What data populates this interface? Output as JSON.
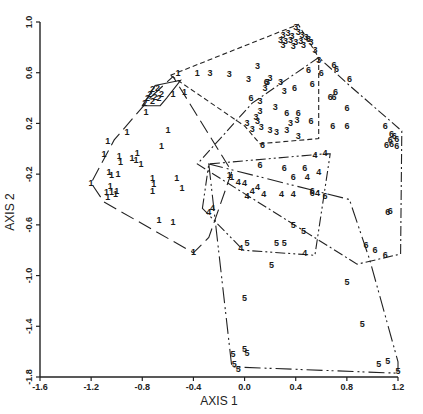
{
  "chart_data": {
    "type": "scatter",
    "title": "",
    "xlabel": "AXIS 1",
    "ylabel": "AXIS 2",
    "xlim": [
      -1.6,
      1.2
    ],
    "ylim": [
      -1.8,
      1.0
    ],
    "xticks": [
      -1.6,
      -1.2,
      -0.8,
      -0.4,
      0.0,
      0.4,
      0.8,
      1.2
    ],
    "xtick_labels": [
      "-1.6",
      "-1.2",
      "-0.8",
      "-0.4",
      "0.0",
      "0.4",
      "0.8",
      "1.2"
    ],
    "yticks": [
      1.0,
      0.6,
      0.2,
      -0.2,
      -0.6,
      -1.0,
      -1.4,
      -1.8
    ],
    "ytick_labels": [
      "1.0",
      "0.6",
      "0.2",
      "-0.2",
      "-0.6",
      "-1.0",
      "-1.4",
      "-1.8"
    ],
    "grid": false,
    "legend": "none (points labeled by group number 1-6; convex hulls enclose each group)",
    "series": [
      {
        "name": "1",
        "marker": "1",
        "hull_style": "long-dash",
        "points": [
          [
            -0.56,
            0.43
          ],
          [
            -0.47,
            0.45
          ],
          [
            -0.77,
            0.29
          ],
          [
            -0.92,
            0.13
          ],
          [
            -0.6,
            0.15
          ],
          [
            -1.07,
            0.06
          ],
          [
            -1.1,
            -0.04
          ],
          [
            -0.98,
            -0.06
          ],
          [
            -0.97,
            -0.1
          ],
          [
            -0.88,
            -0.07
          ],
          [
            -0.85,
            -0.09
          ],
          [
            -0.84,
            -0.03
          ],
          [
            -0.81,
            -0.12
          ],
          [
            -1.06,
            -0.18
          ],
          [
            -1.04,
            -0.21
          ],
          [
            -0.99,
            -0.2
          ],
          [
            -1.05,
            -0.29
          ],
          [
            -1.08,
            -0.34
          ],
          [
            -1.04,
            -0.34
          ],
          [
            -1.01,
            -0.36
          ],
          [
            -1.0,
            -0.33
          ],
          [
            -1.07,
            -0.38
          ],
          [
            -0.72,
            -0.23
          ],
          [
            -0.71,
            -0.28
          ],
          [
            -0.72,
            -0.33
          ],
          [
            -0.53,
            -0.23
          ],
          [
            -0.49,
            -0.31
          ],
          [
            -0.67,
            -0.56
          ],
          [
            -0.56,
            -0.58
          ],
          [
            -0.4,
            -0.81
          ],
          [
            -1.2,
            -0.27
          ],
          [
            -0.12,
            -0.21
          ],
          [
            -0.1,
            -0.22
          ],
          [
            -0.65,
            0.02
          ],
          [
            -0.52,
            0.6
          ],
          [
            -0.37,
            0.6
          ]
        ],
        "hull": [
          [
            -0.72,
            0.42
          ],
          [
            -0.56,
            0.57
          ],
          [
            -0.1,
            -0.18
          ],
          [
            -0.28,
            -0.7
          ],
          [
            -0.4,
            -0.82
          ],
          [
            -1.1,
            -0.42
          ],
          [
            -1.2,
            -0.27
          ],
          [
            -1.02,
            0.07
          ]
        ]
      },
      {
        "name": "2",
        "marker": "2",
        "hull_style": "solid",
        "points": [
          [
            -0.72,
            0.47
          ],
          [
            -0.68,
            0.48
          ],
          [
            -0.74,
            0.43
          ],
          [
            -0.7,
            0.41
          ],
          [
            -0.76,
            0.4
          ],
          [
            -0.72,
            0.38
          ],
          [
            -0.67,
            0.4
          ],
          [
            -0.78,
            0.36
          ],
          [
            -0.65,
            0.43
          ]
        ],
        "hull": [
          [
            -0.8,
            0.34
          ],
          [
            -0.7,
            0.5
          ],
          [
            -0.5,
            0.54
          ],
          [
            -0.61,
            0.4
          ],
          [
            -0.66,
            0.34
          ]
        ]
      },
      {
        "name": "3",
        "marker": "3",
        "hull_style": "short-dash",
        "points": [
          [
            0.4,
            0.96
          ],
          [
            0.3,
            0.9
          ],
          [
            0.34,
            0.91
          ],
          [
            0.37,
            0.89
          ],
          [
            0.42,
            0.92
          ],
          [
            0.45,
            0.9
          ],
          [
            0.48,
            0.88
          ],
          [
            0.28,
            0.86
          ],
          [
            0.32,
            0.85
          ],
          [
            0.36,
            0.86
          ],
          [
            0.4,
            0.84
          ],
          [
            0.44,
            0.85
          ],
          [
            0.5,
            0.87
          ],
          [
            0.52,
            0.84
          ],
          [
            0.3,
            0.82
          ],
          [
            0.38,
            0.81
          ],
          [
            0.46,
            0.82
          ],
          [
            0.55,
            0.78
          ],
          [
            0.58,
            0.7
          ],
          [
            0.1,
            0.65
          ],
          [
            -0.27,
            0.6
          ],
          [
            -0.12,
            0.59
          ],
          [
            0.03,
            0.55
          ],
          [
            0.18,
            0.53
          ],
          [
            0.28,
            0.53
          ],
          [
            0.31,
            0.46
          ],
          [
            0.16,
            0.48
          ],
          [
            0.2,
            0.56
          ],
          [
            0.12,
            0.38
          ],
          [
            0.24,
            0.33
          ],
          [
            0.12,
            0.3
          ],
          [
            0.09,
            0.25
          ],
          [
            0.1,
            0.22
          ],
          [
            0.13,
            0.17
          ],
          [
            0.2,
            0.15
          ],
          [
            0.25,
            0.13
          ],
          [
            0.33,
            0.15
          ],
          [
            0.36,
            0.2
          ],
          [
            0.41,
            0.23
          ],
          [
            0.42,
            0.1
          ],
          [
            0.02,
            0.2
          ],
          [
            0.06,
            0.16
          ]
        ],
        "hull": [
          [
            -0.58,
            0.58
          ],
          [
            0.42,
            0.98
          ],
          [
            0.58,
            0.72
          ],
          [
            0.58,
            0.08
          ],
          [
            0.12,
            0.04
          ],
          [
            0.0,
            0.18
          ]
        ]
      },
      {
        "name": "4",
        "marker": "4",
        "hull_style": "dash-dot-dot",
        "points": [
          [
            -0.28,
            -0.5
          ],
          [
            -0.25,
            -0.47
          ],
          [
            -0.05,
            -0.26
          ],
          [
            0.0,
            -0.27
          ],
          [
            0.06,
            -0.33
          ],
          [
            0.1,
            -0.3
          ],
          [
            0.02,
            -0.37
          ],
          [
            0.15,
            -0.36
          ],
          [
            0.29,
            -0.36
          ],
          [
            0.38,
            -0.36
          ],
          [
            0.49,
            -0.22
          ],
          [
            0.55,
            -0.05
          ],
          [
            0.58,
            -0.18
          ],
          [
            0.57,
            -0.35
          ],
          [
            0.47,
            -0.82
          ],
          [
            -0.03,
            -0.78
          ],
          [
            0.63,
            -0.03
          ]
        ],
        "hull": [
          [
            -0.33,
            -0.47
          ],
          [
            -0.28,
            -0.12
          ],
          [
            0.62,
            -0.04
          ],
          [
            0.67,
            -0.04
          ],
          [
            0.55,
            -0.84
          ],
          [
            -0.01,
            -0.8
          ]
        ]
      },
      {
        "name": "5",
        "marker": "5",
        "hull_style": "long-dash-dot-dot",
        "points": [
          [
            0.38,
            -0.6
          ],
          [
            0.46,
            -0.65
          ],
          [
            0.25,
            -0.74
          ],
          [
            0.31,
            -0.74
          ],
          [
            0.02,
            -0.74
          ],
          [
            0.21,
            -0.92
          ],
          [
            0.0,
            -1.18
          ],
          [
            0.8,
            -1.05
          ],
          [
            0.0,
            -1.58
          ],
          [
            0.02,
            -1.61
          ],
          [
            -0.08,
            -1.7
          ],
          [
            -0.05,
            -1.74
          ],
          [
            0.92,
            -1.38
          ],
          [
            1.05,
            -1.7
          ],
          [
            1.12,
            -1.67
          ],
          [
            1.2,
            -1.75
          ],
          [
            -0.09,
            -1.62
          ]
        ],
        "hull": [
          [
            -0.28,
            -0.12
          ],
          [
            -0.1,
            -1.72
          ],
          [
            1.2,
            -1.77
          ],
          [
            1.2,
            -1.68
          ],
          [
            0.98,
            -0.88
          ],
          [
            0.82,
            -0.4
          ]
        ]
      },
      {
        "name": "6",
        "marker": "6",
        "hull_style": "dash-dot",
        "points": [
          [
            0.7,
            0.66
          ],
          [
            0.72,
            0.63
          ],
          [
            0.82,
            0.55
          ],
          [
            0.5,
            0.62
          ],
          [
            0.6,
            0.6
          ],
          [
            0.53,
            0.51
          ],
          [
            0.39,
            0.48
          ],
          [
            0.71,
            0.45
          ],
          [
            0.67,
            0.41
          ],
          [
            0.7,
            0.41
          ],
          [
            0.8,
            0.32
          ],
          [
            0.33,
            0.28
          ],
          [
            0.42,
            0.28
          ],
          [
            0.52,
            0.22
          ],
          [
            0.69,
            0.18
          ],
          [
            0.8,
            0.18
          ],
          [
            1.1,
            0.18
          ],
          [
            1.15,
            0.12
          ],
          [
            1.17,
            0.1
          ],
          [
            1.14,
            0.07
          ],
          [
            1.19,
            0.08
          ],
          [
            1.15,
            0.04
          ],
          [
            1.11,
            0.03
          ],
          [
            1.19,
            0.02
          ],
          [
            1.12,
            -0.5
          ],
          [
            1.14,
            -0.49
          ],
          [
            0.95,
            -0.76
          ],
          [
            1.02,
            -0.8
          ],
          [
            1.1,
            -0.84
          ],
          [
            0.53,
            -0.33
          ],
          [
            0.53,
            -0.35
          ],
          [
            0.31,
            -0.15
          ],
          [
            0.47,
            -0.15
          ],
          [
            0.63,
            -0.37
          ],
          [
            0.17,
            0.53
          ],
          [
            0.05,
            0.4
          ],
          [
            0.14,
            0.03
          ],
          [
            0.38,
            -0.22
          ],
          [
            0.12,
            -0.13
          ]
        ],
        "hull": [
          [
            0.58,
            0.72
          ],
          [
            0.06,
            0.36
          ],
          [
            -0.37,
            -0.12
          ],
          [
            0.88,
            -0.91
          ],
          [
            1.22,
            -0.83
          ],
          [
            1.23,
            0.14
          ],
          [
            0.82,
            0.5
          ]
        ]
      }
    ]
  }
}
